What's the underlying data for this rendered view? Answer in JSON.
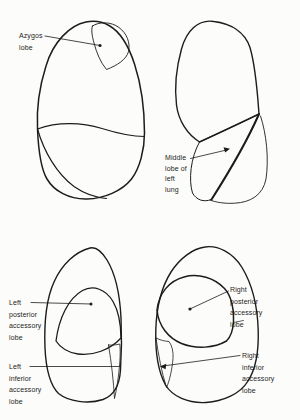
{
  "figure": {
    "ink_color": "#1c1c1c",
    "paper_color": "#fcfcfa",
    "hatch_color": "#2e2e2e",
    "stipple_color": "#4a4a4a",
    "stripe_color": "#666666",
    "labels": {
      "azygos": "Azygos\nlobe",
      "middle": "Middle\nlobe of\nleft\nlung",
      "left_posterior": "Left\nposterior\naccessory\nlobe",
      "left_inferior": "Left\ninferior\naccessory\nlobe",
      "right_posterior": "Right\nposterior\naccessory\nlobe",
      "right_inferior": "Right\ninferior\naccessory\nlobe"
    },
    "regions": [
      {
        "name": "azygos-lobe",
        "pattern": "fine-crosshatch-stipple"
      },
      {
        "name": "middle-lobe-of-left-lung",
        "pattern": "steep-diagonal-hatch"
      },
      {
        "name": "left-posterior-accessory-lobe",
        "pattern": "diagonal-hatch-45"
      },
      {
        "name": "left-inferior-accessory-lobe",
        "pattern": "vertical-stripes"
      },
      {
        "name": "right-posterior-accessory-lobe",
        "pattern": "fine-crosshatch-stipple"
      },
      {
        "name": "right-inferior-accessory-lobe",
        "pattern": "steep-diagonal-stripes"
      }
    ]
  }
}
